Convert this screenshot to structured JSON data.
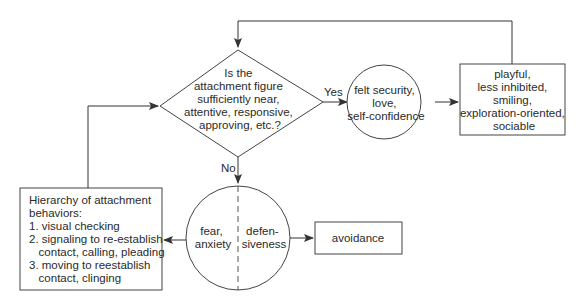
{
  "diagram": {
    "colors": {
      "stroke": "#333333",
      "text": "#2a2a2a",
      "background": "#ffffff"
    },
    "decision": {
      "lines": [
        "Is the",
        "attachment figure",
        "sufficiently near,",
        "attentive, responsive,",
        "approving, etc.?"
      ]
    },
    "edge_labels": {
      "yes": "Yes",
      "no": "No"
    },
    "security_circle": {
      "lines": [
        "felt security,",
        "love,",
        "self-confidence"
      ]
    },
    "outcome_box": {
      "lines": [
        "playful,",
        "less inhibited,",
        "smiling,",
        "exploration-oriented,",
        "sociable"
      ]
    },
    "fear_circle": {
      "left_lines": [
        "fear,",
        "anxiety"
      ],
      "right_lines": [
        "defen-",
        "siveness"
      ]
    },
    "avoidance_box": {
      "label": "avoidance"
    },
    "hierarchy_box": {
      "lines": [
        "Hierarchy of attachment",
        "behaviors:",
        "1. visual checking",
        "2. signaling to re-establish",
        "   contact, calling, pleading",
        "3. moving to reestablish",
        "   contact, clinging"
      ]
    }
  }
}
